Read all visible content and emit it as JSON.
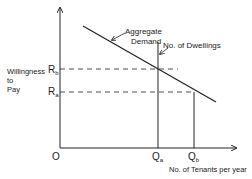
{
  "diagram": {
    "y_label_lines": [
      "Willingness",
      "to",
      "Pay"
    ],
    "x_label": "No. of Tenants per year",
    "origin": "O",
    "y_ticks": [
      {
        "main": "R",
        "sub": "b"
      },
      {
        "main": "R",
        "sub": "a"
      }
    ],
    "x_ticks": [
      {
        "main": "Q",
        "sub": "a"
      },
      {
        "main": "Q",
        "sub": "b"
      }
    ],
    "demand_label_lines": [
      "Aggregate",
      "Demand"
    ],
    "supply_label": "No. of Dwellings",
    "colors": {
      "line": "#222222",
      "background": "#ffffff"
    }
  }
}
